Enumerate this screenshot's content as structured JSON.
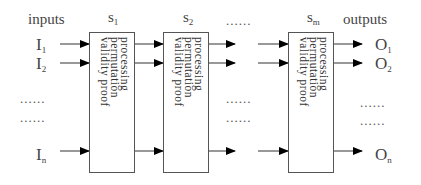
{
  "diagram": {
    "inputs_header": "inputs",
    "outputs_header": "outputs",
    "stage_labels": [
      {
        "base": "s",
        "sub": "1"
      },
      {
        "base": "s",
        "sub": "2"
      },
      {
        "base": "s",
        "sub": "m"
      }
    ],
    "stage_ellipsis": "......",
    "box_text": "processing\npermutation\nvalidity proof",
    "inputs": [
      {
        "base": "I",
        "sub": "1"
      },
      {
        "base": "I",
        "sub": "2"
      },
      {
        "base": "I",
        "sub": "n"
      }
    ],
    "outputs": [
      {
        "base": "O",
        "sub": "1"
      },
      {
        "base": "O",
        "sub": "2"
      },
      {
        "base": "O",
        "sub": "n"
      }
    ],
    "row_ellipsis": "......"
  }
}
